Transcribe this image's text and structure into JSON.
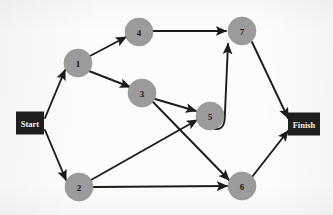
{
  "diagram": {
    "type": "activity-on-node network",
    "canvas": {
      "width": 333,
      "height": 215
    },
    "background_color": "#fbfbfa",
    "node_fill_color": "#9b9b9b",
    "terminal_fill_color": "#1e1e1e",
    "terminal_text_color": "#f2f2f2",
    "edge_color": "#1c1c1c",
    "node_radius": 14
  },
  "terminals": [
    {
      "id": "start",
      "label": "Start",
      "x": 30,
      "y": 123,
      "w": 28,
      "h": 23
    },
    {
      "id": "finish",
      "label": "Finish",
      "x": 304,
      "y": 124,
      "w": 32,
      "h": 23
    }
  ],
  "nodes": [
    {
      "id": "n1",
      "label": "1",
      "x": 78,
      "y": 63
    },
    {
      "id": "n2",
      "label": "2",
      "x": 79,
      "y": 187
    },
    {
      "id": "n3",
      "label": "3",
      "x": 142,
      "y": 93
    },
    {
      "id": "n4",
      "label": "4",
      "x": 139,
      "y": 32
    },
    {
      "id": "n5",
      "label": "5",
      "x": 210,
      "y": 116
    },
    {
      "id": "n6",
      "label": "6",
      "x": 242,
      "y": 186
    },
    {
      "id": "n7",
      "label": "7",
      "x": 242,
      "y": 31
    }
  ],
  "edges": [
    {
      "id": "e-start-1",
      "from": "Start",
      "to": "1",
      "path": "M 45 118 L 65 70",
      "arrow": true
    },
    {
      "id": "e-start-2",
      "from": "Start",
      "to": "2",
      "path": "M 45 130 L 66 180",
      "arrow": true
    },
    {
      "id": "e-1-4",
      "from": "1",
      "to": "4",
      "path": "M 90 56 L 126 37",
      "arrow": true
    },
    {
      "id": "e-1-3",
      "from": "1",
      "to": "3",
      "path": "M 89 71 L 130 87",
      "arrow": true
    },
    {
      "id": "e-4-7",
      "from": "4",
      "to": "7",
      "path": "M 153 31 L 226 31",
      "arrow": true
    },
    {
      "id": "e-3-5",
      "from": "3",
      "to": "5",
      "path": "M 155 99 L 196 111",
      "arrow": true
    },
    {
      "id": "e-3-6",
      "from": "3",
      "to": "6",
      "path": "M 153 102 L 229 180",
      "arrow": true
    },
    {
      "id": "e-2-5",
      "from": "2",
      "to": "5",
      "path": "M 91 180 L 197 120",
      "arrow": true
    },
    {
      "id": "e-2-6",
      "from": "2",
      "to": "6",
      "path": "M 93 187 L 227 186",
      "arrow": true
    },
    {
      "id": "e-5-7",
      "from": "5",
      "to": "7",
      "path": "M 215 129 C 224 130 225 122 225 112 L 228 44",
      "arrow": true
    },
    {
      "id": "e-7-finish",
      "from": "7",
      "to": "Finish",
      "path": "M 252 42 L 288 118",
      "arrow": true
    },
    {
      "id": "e-6-finish",
      "from": "6",
      "to": "Finish",
      "path": "M 252 177 L 288 131",
      "arrow": true
    }
  ]
}
